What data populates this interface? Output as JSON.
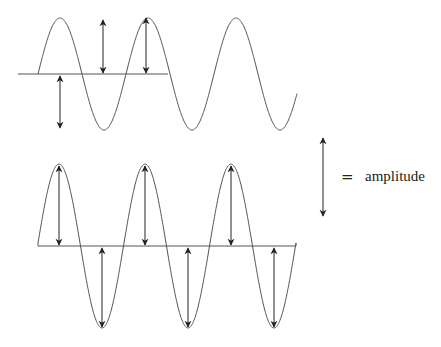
{
  "diagram": {
    "colors": {
      "line": "#555555",
      "arrow": "#222222",
      "text": "#222222",
      "background": "#ffffff"
    },
    "waves": [
      {
        "name": "top-wave",
        "baseline_y": 74,
        "baseline_x": [
          18,
          168
        ],
        "amplitude_px": 56,
        "half_period_px": 44,
        "start_x": 38,
        "end_x": 297,
        "peaks_x": [
          60,
          148,
          236
        ],
        "troughs_x": [
          104,
          192,
          280
        ],
        "arrows": [
          {
            "x": 60,
            "y1": 76,
            "y2": 128,
            "note": "incorrect: baseline to below"
          },
          {
            "x": 103,
            "y1": 20,
            "y2": 73,
            "note": "incorrect: mid-air to baseline"
          },
          {
            "x": 146,
            "y1": 18,
            "y2": 73,
            "note": "peak to baseline"
          }
        ]
      },
      {
        "name": "bottom-wave",
        "baseline_y": 246,
        "baseline_x": [
          38,
          296
        ],
        "amplitude_px": 82,
        "half_period_px": 43,
        "start_x": 38,
        "end_x": 296,
        "peaks_x": [
          59,
          145,
          231
        ],
        "troughs_x": [
          102,
          188,
          274
        ],
        "arrows": [
          {
            "x": 59,
            "y1": 166,
            "y2": 245
          },
          {
            "x": 102,
            "y1": 248,
            "y2": 327
          },
          {
            "x": 145,
            "y1": 166,
            "y2": 245
          },
          {
            "x": 188,
            "y1": 248,
            "y2": 327
          },
          {
            "x": 231,
            "y1": 166,
            "y2": 245
          },
          {
            "x": 274,
            "y1": 248,
            "y2": 327
          }
        ]
      }
    ],
    "legend": {
      "arrow": {
        "x": 323,
        "y1": 138,
        "y2": 216
      },
      "equals": "=",
      "label": "amplitude"
    }
  }
}
